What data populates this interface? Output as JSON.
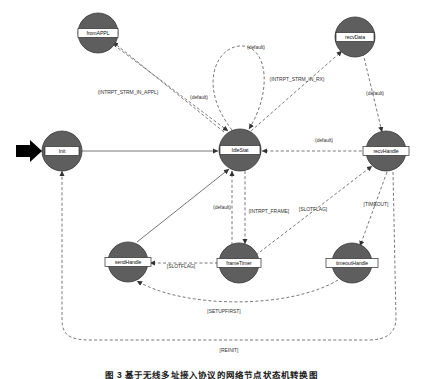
{
  "figure": {
    "caption": "图 3  基于无线多址接入协议的网络节点状态机转换图",
    "type": "state-machine-diagram"
  },
  "nodes": [
    {
      "id": "fromAPPL",
      "label": "fromAPPL",
      "cx": 98,
      "cy": 33
    },
    {
      "id": "recvData",
      "label": "recvData",
      "cx": 355,
      "cy": 37
    },
    {
      "id": "Init",
      "label": "Init",
      "cx": 62,
      "cy": 151
    },
    {
      "id": "IdleStat",
      "label": "IdleStat",
      "cx": 240,
      "cy": 150
    },
    {
      "id": "recvHandle",
      "label": "recvHandle",
      "cx": 386,
      "cy": 151
    },
    {
      "id": "sendHandle",
      "label": "sendHandle",
      "cx": 128,
      "cy": 262
    },
    {
      "id": "frameTimer",
      "label": "frameTimer",
      "cx": 239,
      "cy": 263
    },
    {
      "id": "timeoutHandle",
      "label": "timeoutHandle",
      "cx": 352,
      "cy": 263
    }
  ],
  "edges": [
    {
      "id": "e-idle-self",
      "from": "IdleStat",
      "to": "IdleStat",
      "label": "(default)",
      "lx": 256,
      "ly": 47
    },
    {
      "id": "e-fromappl-idle",
      "from": "fromAPPL",
      "to": "IdleStat",
      "label": "(default)",
      "lx": 199,
      "ly": 97
    },
    {
      "id": "e-idle-fromappl",
      "from": "IdleStat",
      "to": "fromAPPL",
      "label": "(INTRPT_STRM_IN_APPL)",
      "lx": 128,
      "ly": 92
    },
    {
      "id": "e-idle-recvdata",
      "from": "IdleStat",
      "to": "recvData",
      "label": "(INTRPT_STRM_IN_RX)",
      "lx": 297,
      "ly": 79
    },
    {
      "id": "e-recvdata-recvhandle",
      "from": "recvData",
      "to": "recvHandle",
      "label": "(default)",
      "lx": 375,
      "ly": 93
    },
    {
      "id": "e-recvhandle-idle",
      "from": "recvHandle",
      "to": "IdleStat",
      "label": "(default)",
      "lx": 324,
      "ly": 140
    },
    {
      "id": "e-frametimer-idle",
      "from": "frameTimer",
      "to": "IdleStat",
      "label": "(default)",
      "lx": 222,
      "ly": 207
    },
    {
      "id": "e-idle-frametimer",
      "from": "IdleStat",
      "to": "frameTimer",
      "label": "[INTRPT_FRAME]",
      "lx": 269,
      "ly": 211
    },
    {
      "id": "e-frametimer-recvhandle",
      "from": "frameTimer",
      "to": "recvHandle",
      "label": "[SLOTFLAG]",
      "lx": 313,
      "ly": 209
    },
    {
      "id": "e-recvhandle-timeout",
      "from": "recvHandle",
      "to": "timeoutHandle",
      "label": "[TIMEOUT]",
      "lx": 376,
      "ly": 204
    },
    {
      "id": "e-frametimer-sendhandle",
      "from": "frameTimer",
      "to": "sendHandle",
      "label": "[SLOTFLAG]",
      "lx": 181,
      "ly": 266
    },
    {
      "id": "e-sendhandle-idle",
      "from": "sendHandle",
      "to": "IdleStat",
      "label": "",
      "lx": 0,
      "ly": 0
    },
    {
      "id": "e-timeout-sendhandle",
      "from": "timeoutHandle",
      "to": "sendHandle",
      "label": "[SETUPFIRST]",
      "lx": 224,
      "ly": 311
    },
    {
      "id": "e-recvhandle-init",
      "from": "recvHandle",
      "to": "Init",
      "label": "[REINIT]",
      "lx": 229,
      "ly": 350
    },
    {
      "id": "e-start-init",
      "from": "start",
      "to": "Init",
      "label": "",
      "lx": 0,
      "ly": 0
    },
    {
      "id": "e-init-idle",
      "from": "Init",
      "to": "IdleStat",
      "label": "",
      "lx": 0,
      "ly": 0
    }
  ],
  "colors": {
    "node_fill": "#5e5e5e",
    "node_stroke": "#3a3a3a",
    "label_box_fill": "#ffffff",
    "edge_stroke": "#555555",
    "background": "#ffffff"
  }
}
